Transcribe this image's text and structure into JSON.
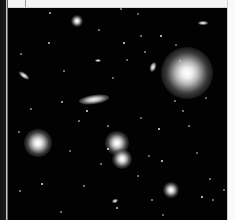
{
  "image": {
    "description": "Deep-field astronomical photograph of a galaxy cluster with white scanned-page margins",
    "background_color": "#020202",
    "objects": [
      {
        "type": "bright-star",
        "x": 187,
        "y": 73,
        "r": 26
      },
      {
        "type": "star-glow",
        "x": 38,
        "y": 143,
        "r": 14
      },
      {
        "type": "star-glow",
        "x": 117,
        "y": 143,
        "r": 12
      },
      {
        "type": "star-glow",
        "x": 122,
        "y": 159,
        "r": 10
      },
      {
        "type": "star-glow",
        "x": 171,
        "y": 190,
        "r": 8
      },
      {
        "type": "star-glow",
        "x": 77,
        "y": 21,
        "r": 6
      },
      {
        "type": "elongated-galaxy",
        "x": 94,
        "y": 99,
        "w": 30,
        "h": 9,
        "angle": -8
      },
      {
        "type": "elongated-galaxy",
        "x": 24,
        "y": 75,
        "w": 12,
        "h": 5,
        "angle": 35
      },
      {
        "type": "elongated-galaxy",
        "x": 203,
        "y": 23,
        "w": 10,
        "h": 4,
        "angle": 0
      },
      {
        "type": "elongated-galaxy",
        "x": 153,
        "y": 67,
        "w": 6,
        "h": 10,
        "angle": 20
      },
      {
        "type": "small-galaxy",
        "x": 115,
        "y": 201,
        "w": 6,
        "h": 4,
        "angle": -20
      },
      {
        "type": "small-galaxy",
        "x": 98,
        "y": 60,
        "w": 6,
        "h": 3,
        "angle": 0
      }
    ],
    "stars": [
      [
        49,
        12
      ],
      [
        98,
        29
      ],
      [
        120,
        8
      ],
      [
        137,
        13
      ],
      [
        123,
        42
      ],
      [
        140,
        35
      ],
      [
        126,
        59
      ],
      [
        144,
        51
      ],
      [
        160,
        35
      ],
      [
        175,
        44
      ],
      [
        30,
        108
      ],
      [
        18,
        131
      ],
      [
        61,
        101
      ],
      [
        78,
        120
      ],
      [
        107,
        125
      ],
      [
        140,
        117
      ],
      [
        158,
        128
      ],
      [
        188,
        125
      ],
      [
        205,
        97
      ],
      [
        209,
        178
      ],
      [
        201,
        196
      ],
      [
        212,
        199
      ],
      [
        223,
        189
      ],
      [
        83,
        185
      ],
      [
        116,
        207
      ],
      [
        60,
        211
      ],
      [
        19,
        190
      ],
      [
        162,
        214
      ],
      [
        107,
        148
      ],
      [
        100,
        163
      ],
      [
        148,
        155
      ],
      [
        137,
        175
      ],
      [
        161,
        160
      ],
      [
        69,
        150
      ],
      [
        174,
        100
      ],
      [
        182,
        110
      ],
      [
        48,
        42
      ],
      [
        20,
        53
      ],
      [
        63,
        70
      ],
      [
        112,
        77
      ],
      [
        86,
        110
      ],
      [
        179,
        60
      ],
      [
        196,
        152
      ],
      [
        151,
        199
      ],
      [
        41,
        183
      ]
    ]
  }
}
